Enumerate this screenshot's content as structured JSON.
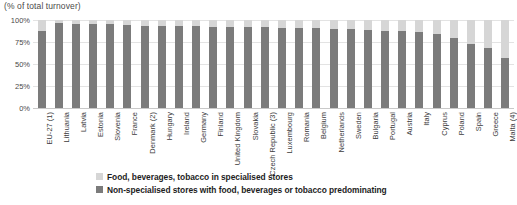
{
  "chart_data": {
    "type": "bar",
    "title": "(% of total turnover)",
    "xlabel": "",
    "ylabel": "",
    "ylim": [
      0,
      100
    ],
    "stacked": true,
    "grid": true,
    "legend_position": "bottom",
    "ytick_labels": [
      "100%",
      "75%",
      "50%",
      "25%",
      "0%"
    ],
    "ytick_values": [
      100,
      75,
      50,
      25,
      0
    ],
    "categories": [
      "EU-27 (1)",
      "Lithuania",
      "Latvia",
      "Estonia",
      "Slovenia",
      "France",
      "Denmark (2)",
      "Hungary",
      "Ireland",
      "Germany",
      "Finland",
      "United Kingdom",
      "Slovakia",
      "Czech Republic (3)",
      "Luxembourg",
      "Romania",
      "Belgium",
      "Netherlands",
      "Sweden",
      "Bulgaria",
      "Portugal",
      "Austria",
      "Italy",
      "Cyprus",
      "Poland",
      "Spain",
      "Greece",
      "Malta (4)"
    ],
    "series": [
      {
        "name": "Non-specialised stores with food, beverages or tobacco predominating",
        "color": "#7b7b7b",
        "values": [
          88,
          97,
          96,
          96,
          95,
          94,
          93,
          93,
          93,
          93,
          92,
          92,
          92,
          92,
          91,
          91,
          91,
          90,
          90,
          89,
          88,
          87,
          86,
          84,
          80,
          73,
          68,
          57
        ]
      },
      {
        "name": "Food, beverages, tobacco in specialised stores",
        "color": "#d6d6d6",
        "values": [
          12,
          3,
          4,
          4,
          5,
          6,
          7,
          7,
          7,
          7,
          8,
          8,
          8,
          8,
          9,
          9,
          9,
          10,
          10,
          11,
          12,
          13,
          14,
          16,
          20,
          27,
          32,
          43
        ]
      }
    ]
  },
  "legend": {
    "items": [
      {
        "label": "Food, beverages, tobacco in specialised stores",
        "color": "#d6d6d6",
        "swatch": "light"
      },
      {
        "label": "Non-specialised stores with food, beverages or tobacco predominating",
        "color": "#7b7b7b",
        "swatch": "dark"
      }
    ]
  }
}
